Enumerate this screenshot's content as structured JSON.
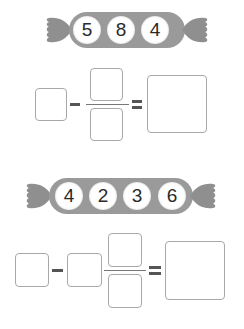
{
  "problems": [
    {
      "candy": {
        "digits": [
          "5",
          "8",
          "4"
        ],
        "body_color": "#9a9a9a",
        "ball_color": "#ffffff"
      },
      "equation": {
        "structure": [
          "box",
          "-",
          "fraction(box/box)",
          "=",
          "box"
        ],
        "operator": "-",
        "equals": "="
      }
    },
    {
      "candy": {
        "digits": [
          "4",
          "2",
          "3",
          "6"
        ],
        "body_color": "#9a9a9a",
        "ball_color": "#ffffff"
      },
      "equation": {
        "structure": [
          "box",
          "-",
          "box",
          "fraction(box/box)",
          "=",
          "box"
        ],
        "operator": "-",
        "equals": "="
      }
    }
  ]
}
